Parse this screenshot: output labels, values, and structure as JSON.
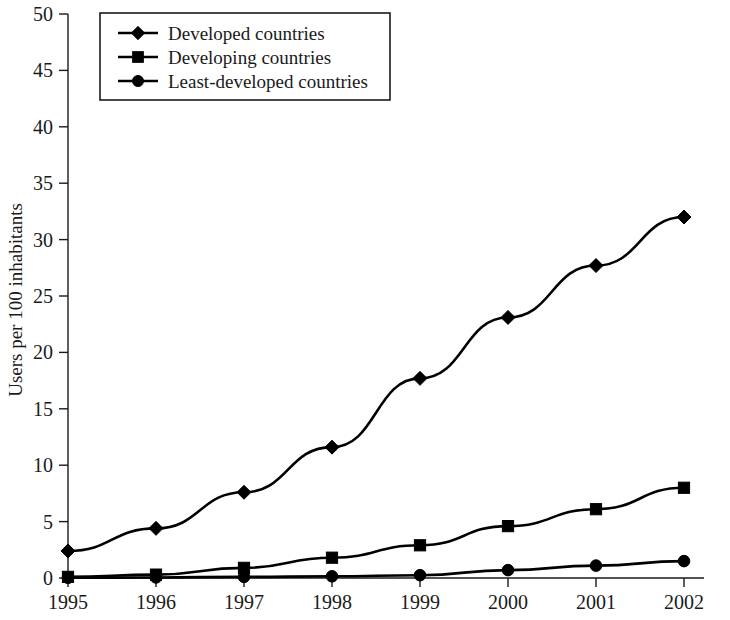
{
  "chart_data": {
    "type": "line",
    "title": "",
    "subtitle": "",
    "xlabel": "",
    "ylabel": "Users per 100 inhabitants",
    "categories": [
      "1995",
      "1996",
      "1997",
      "1998",
      "1999",
      "2000",
      "2001",
      "2002"
    ],
    "x": [
      1995,
      1996,
      1997,
      1998,
      1999,
      2000,
      2001,
      2002
    ],
    "xlim": [
      1995,
      2002
    ],
    "ylim": [
      0,
      50
    ],
    "y_ticks": [
      0,
      5,
      10,
      15,
      20,
      25,
      30,
      35,
      40,
      45,
      50
    ],
    "y_tick_labels": [
      "0",
      "5",
      "10",
      "15",
      "20",
      "25",
      "30",
      "35",
      "40",
      "45",
      "50"
    ],
    "grid": false,
    "legend_position": "top-left",
    "series": [
      {
        "name": "Developed countries",
        "marker": "diamond",
        "color": "#000000",
        "values": [
          2.4,
          4.4,
          7.6,
          11.6,
          17.7,
          23.1,
          27.7,
          32.0
        ]
      },
      {
        "name": "Developing countries",
        "marker": "square",
        "color": "#000000",
        "values": [
          0.1,
          0.3,
          0.9,
          1.8,
          2.9,
          4.6,
          6.1,
          8.0
        ]
      },
      {
        "name": "Least-developed countries",
        "marker": "circle",
        "color": "#000000",
        "values": [
          0.02,
          0.05,
          0.1,
          0.15,
          0.25,
          0.7,
          1.1,
          1.5
        ]
      }
    ]
  },
  "legend": {
    "entries": [
      {
        "label": "Developed countries",
        "marker": "diamond"
      },
      {
        "label": "Developing countries",
        "marker": "square"
      },
      {
        "label": "Least-developed countries",
        "marker": "circle"
      }
    ]
  },
  "axes": {
    "y_title": "Users per 100 inhabitants",
    "y_tick_labels": [
      "50",
      "45",
      "40",
      "35",
      "30",
      "25",
      "20",
      "15",
      "10",
      "5",
      "0"
    ],
    "x_tick_labels": [
      "1995",
      "1996",
      "1997",
      "1998",
      "1999",
      "2000",
      "2001",
      "2002"
    ]
  },
  "colors": {
    "line": "#000000",
    "axis": "#1a1a1a",
    "background": "#ffffff"
  }
}
